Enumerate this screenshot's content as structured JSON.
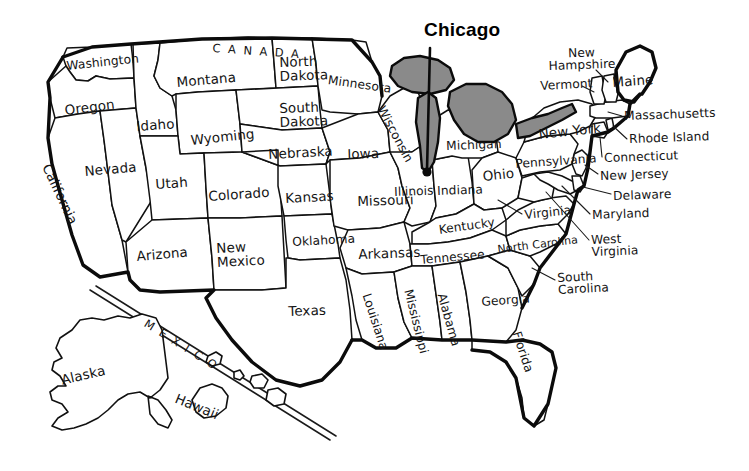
{
  "map": {
    "title": "United States map with state labels",
    "background_color": "#ffffff",
    "ink_color": "#111111",
    "lake_fill_color": "#8a8a8a"
  },
  "callout": {
    "label": "Chicago",
    "kind": "city-annotation"
  },
  "country_labels": [
    {
      "name": "canada",
      "text": "CANADA"
    },
    {
      "name": "mexico",
      "text": "MEXICO"
    }
  ],
  "states": [
    {
      "name": "washington",
      "label": "Washington"
    },
    {
      "name": "oregon",
      "label": "Oregon"
    },
    {
      "name": "california",
      "label": "California"
    },
    {
      "name": "nevada",
      "label": "Nevada"
    },
    {
      "name": "idaho",
      "label": "Idaho"
    },
    {
      "name": "montana",
      "label": "Montana"
    },
    {
      "name": "wyoming",
      "label": "Wyoming"
    },
    {
      "name": "utah",
      "label": "Utah"
    },
    {
      "name": "arizona",
      "label": "Arizona"
    },
    {
      "name": "colorado",
      "label": "Colorado"
    },
    {
      "name": "new-mexico",
      "label": "New\nMexico"
    },
    {
      "name": "north-dakota",
      "label": "North\nDakota"
    },
    {
      "name": "south-dakota",
      "label": "South\nDakota"
    },
    {
      "name": "nebraska",
      "label": "Nebraska"
    },
    {
      "name": "kansas",
      "label": "Kansas"
    },
    {
      "name": "oklahoma",
      "label": "Oklahoma"
    },
    {
      "name": "texas",
      "label": "Texas"
    },
    {
      "name": "minnesota",
      "label": "Minnesota"
    },
    {
      "name": "iowa",
      "label": "Iowa"
    },
    {
      "name": "missouri",
      "label": "Missouri"
    },
    {
      "name": "arkansas",
      "label": "Arkansas"
    },
    {
      "name": "louisiana",
      "label": "Louisiana"
    },
    {
      "name": "wisconsin",
      "label": "Wisconsin"
    },
    {
      "name": "illinois",
      "label": "Illinois"
    },
    {
      "name": "indiana",
      "label": "Indiana"
    },
    {
      "name": "michigan",
      "label": "Michigan"
    },
    {
      "name": "ohio",
      "label": "Ohio"
    },
    {
      "name": "kentucky",
      "label": "Kentucky"
    },
    {
      "name": "tennessee",
      "label": "Tennessee"
    },
    {
      "name": "mississippi",
      "label": "Mississippi"
    },
    {
      "name": "alabama",
      "label": "Alabama"
    },
    {
      "name": "georgia",
      "label": "Georgia"
    },
    {
      "name": "florida",
      "label": "Florida"
    },
    {
      "name": "south-carolina",
      "label": "South\nCarolina"
    },
    {
      "name": "north-carolina",
      "label": "North Carolina"
    },
    {
      "name": "virginia",
      "label": "Virginia"
    },
    {
      "name": "west-virginia",
      "label": "West\nVirginia"
    },
    {
      "name": "maryland",
      "label": "Maryland"
    },
    {
      "name": "delaware",
      "label": "Delaware"
    },
    {
      "name": "new-jersey",
      "label": "New Jersey"
    },
    {
      "name": "pennsylvania",
      "label": "Pennsylvania"
    },
    {
      "name": "new-york",
      "label": "New York"
    },
    {
      "name": "connecticut",
      "label": "Connecticut"
    },
    {
      "name": "rhode-island",
      "label": "Rhode Island"
    },
    {
      "name": "massachusetts",
      "label": "Massachusetts"
    },
    {
      "name": "vermont",
      "label": "Vermont"
    },
    {
      "name": "new-hampshire",
      "label": "New\nHampshire"
    },
    {
      "name": "maine",
      "label": "Maine"
    },
    {
      "name": "alaska",
      "label": "Alaska"
    },
    {
      "name": "hawaii",
      "label": "Hawaii"
    }
  ],
  "labels": {
    "washington": "Washington",
    "oregon": "Oregon",
    "california": "California",
    "nevada": "Nevada",
    "idaho": "Idaho",
    "montana": "Montana",
    "wyoming": "Wyoming",
    "utah": "Utah",
    "arizona": "Arizona",
    "colorado": "Colorado",
    "new_mexico_l1": "New",
    "new_mexico_l2": "Mexico",
    "north_dakota_l1": "North",
    "north_dakota_l2": "Dakota",
    "south_dakota_l1": "South",
    "south_dakota_l2": "Dakota",
    "nebraska": "Nebraska",
    "kansas": "Kansas",
    "oklahoma": "Oklahoma",
    "texas": "Texas",
    "minnesota": "Minnesota",
    "iowa": "Iowa",
    "missouri": "Missouri",
    "arkansas": "Arkansas",
    "louisiana": "Louisiana",
    "wisconsin": "Wisconsin",
    "illinois": "Illinois",
    "indiana": "Indiana",
    "michigan": "Michigan",
    "ohio": "Ohio",
    "kentucky": "Kentucky",
    "tennessee": "Tennessee",
    "mississippi": "Mississippi",
    "alabama": "Alabama",
    "georgia": "Georgia",
    "florida": "Florida",
    "south_carolina_l1": "South",
    "south_carolina_l2": "Carolina",
    "north_carolina": "North Carolina",
    "virginia": "Virginia",
    "west_virginia_l1": "West",
    "west_virginia_l2": "Virginia",
    "maryland": "Maryland",
    "delaware": "Delaware",
    "new_jersey": "New Jersey",
    "pennsylvania": "Pennsylvania",
    "new_york": "New York",
    "connecticut": "Connecticut",
    "rhode_island": "Rhode Island",
    "massachusetts": "Massachusetts",
    "vermont": "Vermont",
    "new_hampshire_l1": "New",
    "new_hampshire_l2": "Hampshire",
    "maine": "Maine",
    "alaska": "Alaska",
    "hawaii": "Hawaii",
    "canada": "CANADA",
    "mexico": "MEXICO",
    "chicago": "Chicago"
  }
}
